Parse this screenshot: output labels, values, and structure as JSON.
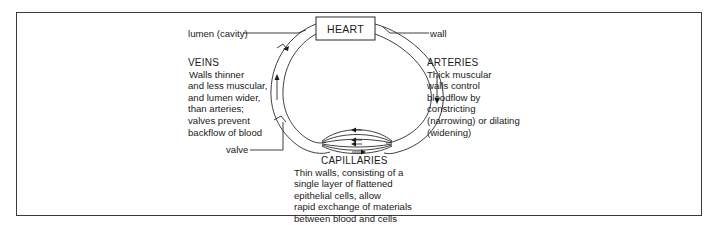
{
  "diagram": {
    "type": "circulatory-vessel-loop",
    "heart": {
      "label": "HEART"
    },
    "callouts": {
      "lumen": "lumen (cavity)",
      "wall": "wall",
      "valve": "valve"
    },
    "veins": {
      "title": "VEINS",
      "lines": [
        "Walls thinner",
        "and less muscular,",
        "and lumen wider,",
        "than arteries;",
        "valves prevent",
        "backflow of blood"
      ]
    },
    "arteries": {
      "title": "ARTERIES",
      "lines": [
        "Thick muscular",
        "walls control",
        "bloodflow by",
        "constricting",
        "(narrowing) or dilating",
        "(widening)"
      ]
    },
    "capillaries": {
      "title": "CAPILLARIES",
      "lines": [
        "Thin walls, consisting of a",
        "single layer of flattened",
        "epithelial cells, allow",
        "rapid exchange of materials",
        "between blood and cells"
      ]
    },
    "colors": {
      "line": "#2a2a2a",
      "text": "#1a1a1a",
      "background": "#ffffff"
    }
  }
}
